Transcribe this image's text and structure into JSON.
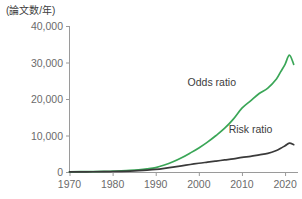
{
  "chart_data": {
    "type": "line",
    "title": "",
    "subtitle": "",
    "unit_label": "(論文数/年)",
    "xlabel": "",
    "ylabel": "",
    "xlim": [
      1970,
      2023
    ],
    "ylim": [
      0,
      40000
    ],
    "grid": false,
    "legend_position": "inline-annotation",
    "x_ticks": [
      1970,
      1980,
      1990,
      2000,
      2010,
      2020
    ],
    "x_tick_labels": [
      "1970",
      "1980",
      "1990",
      "2000",
      "2010",
      "2020"
    ],
    "y_ticks": [
      0,
      10000,
      20000,
      30000,
      40000
    ],
    "y_tick_labels": [
      "0",
      "10,000",
      "20,000",
      "30,000",
      "40,000"
    ],
    "series": [
      {
        "name": "Odds ratio",
        "color": "#3aa657",
        "label_x": 2003,
        "label_y": 23500,
        "x": [
          1970,
          1974,
          1978,
          1980,
          1982,
          1984,
          1986,
          1988,
          1990,
          1992,
          1994,
          1996,
          1998,
          2000,
          2002,
          2004,
          2006,
          2008,
          2010,
          2012,
          2014,
          2016,
          2018,
          2019,
          2020,
          2021,
          2022
        ],
        "values": [
          60,
          90,
          150,
          220,
          300,
          420,
          600,
          850,
          1200,
          1900,
          2800,
          3900,
          5200,
          6600,
          8200,
          10000,
          12000,
          14500,
          17500,
          19500,
          21500,
          23000,
          25500,
          27500,
          29500,
          32000,
          29500
        ]
      },
      {
        "name": "Risk ratio",
        "color": "#3a3a3a",
        "label_x": 2012,
        "label_y": 10800,
        "x": [
          1970,
          1974,
          1978,
          1980,
          1982,
          1984,
          1986,
          1988,
          1990,
          1992,
          1994,
          1996,
          1998,
          2000,
          2002,
          2004,
          2006,
          2008,
          2010,
          2012,
          2014,
          2016,
          2018,
          2019,
          2020,
          2021,
          2022
        ],
        "values": [
          40,
          60,
          100,
          140,
          190,
          260,
          360,
          500,
          700,
          1000,
          1350,
          1700,
          2050,
          2400,
          2700,
          3000,
          3300,
          3600,
          4000,
          4300,
          4700,
          5100,
          5900,
          6500,
          7200,
          7900,
          7500
        ]
      }
    ]
  }
}
